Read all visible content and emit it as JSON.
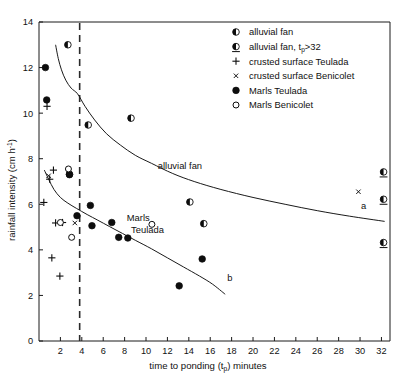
{
  "chart_data": {
    "type": "scatter",
    "title": "",
    "xlabel": "time to ponding  (tp) minutes",
    "xlabel_main": "time to ponding",
    "xlabel_paren_open": "(t",
    "xlabel_sub": "p",
    "xlabel_paren_close": ")",
    "xlabel_tail": "minutes",
    "ylabel": "rainfall intensity (cm h-1)",
    "ylabel_main": "rainfall intensity  (cm h",
    "ylabel_sup": "-1",
    "ylabel_tail": ")",
    "xlim": [
      0,
      32.8
    ],
    "ylim": [
      0,
      14
    ],
    "xticks": [
      2,
      4,
      6,
      8,
      10,
      12,
      14,
      16,
      18,
      20,
      22,
      24,
      26,
      28,
      30,
      32
    ],
    "yticks": [
      0,
      2,
      4,
      6,
      8,
      10,
      12,
      14
    ],
    "xticklabels": [
      "2",
      "4",
      "6",
      "8",
      "10",
      "12",
      "14",
      "16",
      "18",
      "20",
      "22",
      "24",
      "26",
      "28",
      "30",
      "32"
    ],
    "yticklabels": [
      "0",
      "2",
      "4",
      "6",
      "8",
      "10",
      "12",
      "14"
    ],
    "grid": false,
    "legend_position": "top-right",
    "legend": [
      {
        "marker": "half-left-circle",
        "label": "alluvial fan"
      },
      {
        "marker": "half-left-circle-underlined",
        "label_main": "alluvial fan, t",
        "label_sub": "p",
        "label_tail": ">32",
        "label": "alluvial fan, tp>32"
      },
      {
        "marker": "plus",
        "label": "crusted surface Teulada"
      },
      {
        "marker": "cross",
        "label": "crusted surface Benicolet"
      },
      {
        "marker": "filled-circle",
        "label": "Marls Teulada"
      },
      {
        "marker": "open-circle",
        "label": "Marls Benicolet"
      }
    ],
    "annotations": [
      {
        "text": "alluvial fan",
        "x": 11.1,
        "y": 7.55,
        "name": "alluvial-fan-curve-label"
      },
      {
        "text": "Marls",
        "x": 8.2,
        "y": 5.25,
        "name": "marls-teulada-label-line1"
      },
      {
        "text": "Teulada",
        "x": 8.6,
        "y": 4.72,
        "name": "marls-teulada-label-line2"
      },
      {
        "text": "a",
        "x": 30.1,
        "y": 5.78,
        "name": "curve-a-label"
      },
      {
        "text": "b",
        "x": 17.6,
        "y": 2.62,
        "name": "curve-b-label"
      }
    ],
    "vertical_reference_line": {
      "x": 3.8,
      "style": "dashed",
      "label": ""
    },
    "curves": [
      {
        "name": "a",
        "description": "alluvial fan regression curve",
        "points": [
          [
            1.55,
            13.0
          ],
          [
            1.8,
            12.4
          ],
          [
            2.1,
            11.9
          ],
          [
            2.5,
            11.45
          ],
          [
            3.0,
            11.1
          ],
          [
            3.6,
            10.85
          ],
          [
            4.3,
            10.3
          ],
          [
            5.2,
            9.7
          ],
          [
            6.3,
            9.1
          ],
          [
            7.6,
            8.6
          ],
          [
            9.0,
            8.15
          ],
          [
            10.5,
            7.8
          ],
          [
            12.5,
            7.35
          ],
          [
            14.5,
            7.0
          ],
          [
            17.0,
            6.65
          ],
          [
            20.0,
            6.3
          ],
          [
            23.0,
            6.0
          ],
          [
            26.0,
            5.72
          ],
          [
            29.0,
            5.48
          ],
          [
            32.3,
            5.25
          ]
        ]
      },
      {
        "name": "b",
        "description": "marls regression curve",
        "points": [
          [
            0.5,
            7.5
          ],
          [
            0.9,
            7.1
          ],
          [
            1.4,
            6.65
          ],
          [
            2.0,
            6.3
          ],
          [
            2.7,
            6.05
          ],
          [
            3.5,
            5.82
          ],
          [
            4.5,
            5.55
          ],
          [
            5.5,
            5.3
          ],
          [
            6.6,
            5.02
          ],
          [
            7.8,
            4.72
          ],
          [
            9.0,
            4.42
          ],
          [
            10.5,
            4.05
          ],
          [
            12.0,
            3.65
          ],
          [
            13.5,
            3.25
          ],
          [
            15.0,
            2.85
          ],
          [
            16.2,
            2.5
          ],
          [
            17.4,
            2.05
          ]
        ]
      }
    ],
    "series": [
      {
        "name": "alluvial fan",
        "marker": "half-left-circle",
        "points": [
          [
            2.7,
            13.0
          ],
          [
            4.6,
            9.48
          ],
          [
            8.6,
            9.78
          ],
          [
            14.1,
            6.1
          ],
          [
            15.4,
            5.15
          ],
          [
            2.85,
            7.32
          ]
        ]
      },
      {
        "name": "alluvial fan, tp>32",
        "marker": "half-left-circle-underlined",
        "points": [
          [
            32.2,
            7.42
          ],
          [
            32.2,
            6.22
          ],
          [
            32.2,
            4.32
          ]
        ]
      },
      {
        "name": "crusted surface Teulada",
        "marker": "plus",
        "points": [
          [
            0.75,
            10.3
          ],
          [
            0.45,
            6.08
          ],
          [
            1.0,
            7.1
          ],
          [
            1.35,
            7.5
          ],
          [
            1.55,
            5.18
          ],
          [
            2.2,
            5.2
          ],
          [
            1.2,
            3.65
          ],
          [
            1.95,
            2.85
          ]
        ]
      },
      {
        "name": "crusted surface Benicolet",
        "marker": "cross",
        "points": [
          [
            0.9,
            7.25
          ],
          [
            3.35,
            5.18
          ],
          [
            29.85,
            6.55
          ],
          [
            3.05,
            4.55
          ]
        ]
      },
      {
        "name": "Marls Teulada",
        "marker": "filled-circle",
        "points": [
          [
            0.6,
            12.0
          ],
          [
            0.72,
            10.58
          ],
          [
            2.85,
            7.3
          ],
          [
            3.55,
            5.5
          ],
          [
            4.8,
            5.95
          ],
          [
            4.95,
            5.06
          ],
          [
            6.8,
            5.2
          ],
          [
            7.45,
            4.55
          ],
          [
            8.3,
            4.52
          ],
          [
            13.1,
            2.42
          ],
          [
            15.25,
            3.6
          ]
        ]
      },
      {
        "name": "Marls Benicolet",
        "marker": "open-circle",
        "points": [
          [
            2.75,
            7.55
          ],
          [
            2.0,
            5.2
          ],
          [
            3.05,
            4.55
          ]
        ]
      }
    ]
  }
}
